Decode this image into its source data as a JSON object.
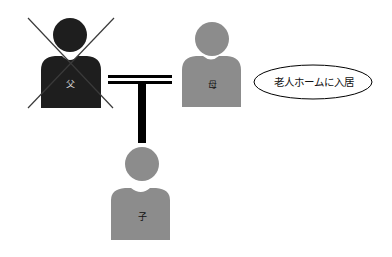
{
  "colors": {
    "father": "#1e1e1e",
    "mother": "#8c8c8c",
    "child": "#8c8c8c",
    "lines": "#000000",
    "father_label": "#d8d8d8",
    "gray_label": "#111111"
  },
  "people": {
    "father": {
      "label": "父",
      "crossed_out": true
    },
    "mother": {
      "label": "母"
    },
    "child": {
      "label": "子"
    }
  },
  "note": {
    "text": "老人ホームに入居"
  }
}
